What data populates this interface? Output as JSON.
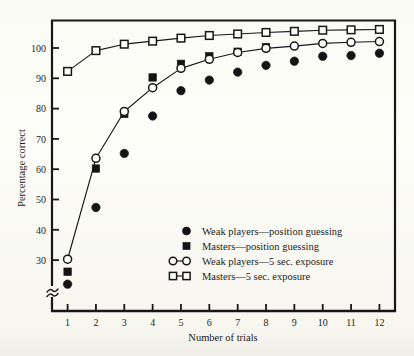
{
  "chart_data": {
    "type": "scatter",
    "title": "",
    "xlabel": "Number of trials",
    "ylabel": "Percentage correct",
    "x": [
      1,
      2,
      3,
      4,
      5,
      6,
      7,
      8,
      9,
      10,
      11,
      12
    ],
    "categories": [
      "1",
      "2",
      "3",
      "4",
      "5",
      "6",
      "7",
      "8",
      "9",
      "10",
      "11",
      "12"
    ],
    "xlim": [
      0.45,
      12.55
    ],
    "ylim": [
      27,
      104
    ],
    "yticks": [
      30,
      40,
      50,
      60,
      70,
      80,
      90,
      100
    ],
    "ytick_labels": [
      "30",
      "40",
      "50",
      "60",
      "70",
      "80",
      "90",
      "100"
    ],
    "axis_break": true,
    "axis_break_symbol": "≈",
    "grid": false,
    "legend_position": "inside lower right",
    "series": [
      {
        "name": "Weak players—position guessing",
        "marker": "filled-circle",
        "line": false,
        "values": [
          34.1,
          54.4,
          68.7,
          78.6,
          85.3,
          88.1,
          90.2,
          92.0,
          93.1,
          94.4,
          94.6,
          95.2
        ]
      },
      {
        "name": "Masters—position guessing",
        "marker": "filled-square",
        "line": false,
        "values": [
          37.4,
          64.7,
          79.2,
          88.8,
          92.4,
          94.4,
          95.6,
          96.8,
          null,
          null,
          null,
          null
        ]
      },
      {
        "name": "Weak players—5 sec. exposure",
        "marker": "open-circle",
        "line": true,
        "values": [
          40.7,
          67.4,
          79.8,
          86.1,
          91.2,
          93.6,
          95.4,
          96.5,
          97.1,
          97.8,
          98.1,
          98.3
        ]
      },
      {
        "name": "Masters—5 sec. exposure",
        "marker": "open-square",
        "line": true,
        "values": [
          90.4,
          95.9,
          97.6,
          98.4,
          99.2,
          99.9,
          100.3,
          100.7,
          101.0,
          101.3,
          101.4,
          101.5
        ]
      }
    ]
  },
  "legend": {
    "entries": [
      {
        "label": "Weak players—position guessing",
        "marker": "filled-circle",
        "with_line": false
      },
      {
        "label": "Masters—position guessing",
        "marker": "filled-square",
        "with_line": false
      },
      {
        "label": "Weak players—5 sec. exposure",
        "marker": "open-circle",
        "with_line": true
      },
      {
        "label": "Masters—5 sec. exposure",
        "marker": "open-square",
        "with_line": true
      }
    ]
  },
  "colors": {
    "ink": "#17171a",
    "paper": "#fcfcf7",
    "marker_fill": "#141416",
    "marker_open": "#fdfdf9"
  }
}
